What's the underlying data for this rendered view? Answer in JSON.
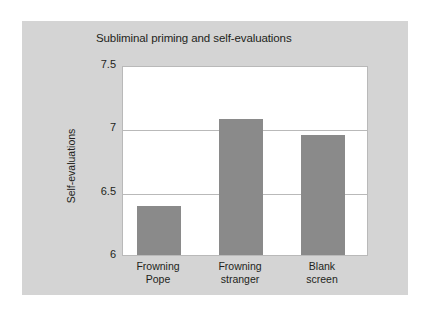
{
  "chart_data": {
    "type": "bar",
    "title": "Subliminal priming and self-evaluations",
    "xlabel": "",
    "ylabel": "Self-evaluations",
    "categories": [
      "Frowning Pope",
      "Frowning stranger",
      "Blank screen"
    ],
    "category_lines": [
      [
        "Frowning",
        "Pope"
      ],
      [
        "Frowning",
        "stranger"
      ],
      [
        "Blank",
        "screen"
      ]
    ],
    "values": [
      6.39,
      7.07,
      6.95
    ],
    "ylim": [
      6,
      7.5
    ],
    "yticks": [
      7.5,
      7,
      6.5,
      6
    ],
    "ytick_labels": [
      "7.5",
      "7",
      "6.5",
      "6"
    ],
    "gridlines": [
      7.0,
      6.5
    ],
    "grid": true,
    "legend": false,
    "legend_position": "none",
    "bar_color": "#8a8a8a",
    "plot_background": "#ffffff",
    "panel_background": "#d4d4d4",
    "page_background": "#ffffff",
    "grid_color": "#b9b9b9",
    "text_color": "#231f20"
  }
}
